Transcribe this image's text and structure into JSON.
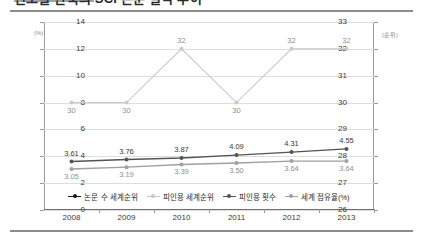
{
  "header": {
    "title": "연도별 한국의 SCI 논문 실적 추이",
    "has_top_rule": true,
    "has_bottom_rule": true
  },
  "chart_data": {
    "type": "line",
    "title": "연도별 한국의 SCI 논문 실적 추이",
    "xlabel": "",
    "categories": [
      "2008",
      "2009",
      "2010",
      "2011",
      "2012",
      "2013"
    ],
    "grid": true,
    "legend_position": "bottom",
    "axes": {
      "left": {
        "unit": "(%)",
        "min": 0,
        "max": 14,
        "ticks": [
          "0",
          "2",
          "4",
          "6",
          "8",
          "10",
          "12",
          "14"
        ]
      },
      "right": {
        "unit": "(순위)",
        "min": 26,
        "max": 33,
        "ticks": [
          "26",
          "27",
          "28",
          "29",
          "30",
          "31",
          "32",
          "33"
        ]
      }
    },
    "series": [
      {
        "name": "논문 수 세계순위",
        "axis": "right",
        "color": "#1a1a1a",
        "marker": "diamond",
        "values": [
          12,
          12,
          11,
          11,
          10,
          12
        ],
        "labels": [
          "12",
          "12",
          "11",
          "11",
          "10",
          "12"
        ]
      },
      {
        "name": "피인용 세계순위",
        "axis": "right",
        "color": "#c9c9c9",
        "marker": "circle",
        "values": [
          30,
          30,
          32,
          30,
          32,
          32
        ],
        "labels": [
          "30",
          "30",
          "32",
          "30",
          "32",
          "32"
        ]
      },
      {
        "name": "피인용 횟수",
        "axis": "left",
        "color": "#545454",
        "marker": "circle",
        "values": [
          3.61,
          3.76,
          3.87,
          4.09,
          4.31,
          4.55
        ],
        "labels": [
          "3.61",
          "3.76",
          "3.87",
          "4.09",
          "4.31",
          "4.55"
        ]
      },
      {
        "name": "세계 점유율(%)",
        "axis": "left",
        "color": "#a0a0a0",
        "marker": "circle",
        "values": [
          3.05,
          3.19,
          3.39,
          3.5,
          3.64,
          3.64
        ],
        "labels": [
          "3.05",
          "3.19",
          "3.39",
          "3.50",
          "3.64",
          "3.64"
        ]
      }
    ]
  }
}
